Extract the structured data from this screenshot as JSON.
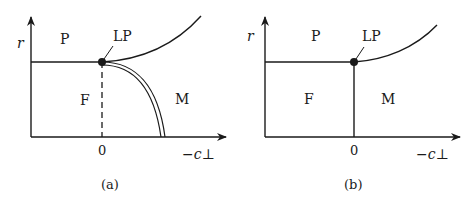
{
  "panels": [
    {
      "caption": "(a)",
      "y_axis_label": "r",
      "x_axis_label": "−c⊥",
      "origin_tick": "0",
      "regions": {
        "paramagnetic": "P",
        "ferromagnetic": "F",
        "modulated": "M"
      },
      "point_label": "LP",
      "boundaries": [
        "P–F horizontal line",
        "P–M curve",
        "F–M double line (first order)",
        "dashed vertical at 0"
      ]
    },
    {
      "caption": "(b)",
      "y_axis_label": "r",
      "x_axis_label": "−c⊥",
      "origin_tick": "0",
      "regions": {
        "paramagnetic": "P",
        "ferromagnetic": "F",
        "modulated": "M"
      },
      "point_label": "LP",
      "boundaries": [
        "P–F horizontal line",
        "P–M curve",
        "F–M vertical line at 0"
      ]
    }
  ],
  "colors": {
    "ink": "#1a1a1a",
    "background": "#ffffff"
  }
}
